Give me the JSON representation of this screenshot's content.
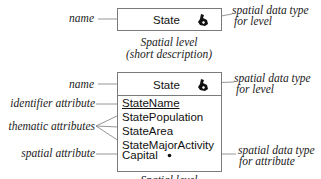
{
  "short_level": {
    "title": "State",
    "icon": "spatial-region-icon",
    "caption_line1": "Spatial level",
    "caption_line2": "(short description)",
    "left_label": "name",
    "right_label_line1": "spatial data type",
    "right_label_line2": "for level"
  },
  "full_level": {
    "title": "State",
    "icon": "spatial-region-icon",
    "caption_line1": "Spatial level",
    "left_labels": {
      "name": "name",
      "identifier": "identifier attribute",
      "thematic": "thematic attributes",
      "spatial": "spatial attribute"
    },
    "right_labels": {
      "level_line1": "spatial data type",
      "level_line2": "for level",
      "attribute_line1": "spatial data type",
      "attribute_line2": "for attribute"
    },
    "attributes": [
      {
        "name": "StateName",
        "kind": "identifier"
      },
      {
        "name": "StatePopulation",
        "kind": "thematic"
      },
      {
        "name": "StateArea",
        "kind": "thematic"
      },
      {
        "name": "StateMajorActivity",
        "kind": "thematic"
      },
      {
        "name": "Capital",
        "kind": "spatial",
        "icon": "point-icon"
      }
    ]
  },
  "colors": {
    "line": "#7a7a7a",
    "text": "#111111"
  }
}
